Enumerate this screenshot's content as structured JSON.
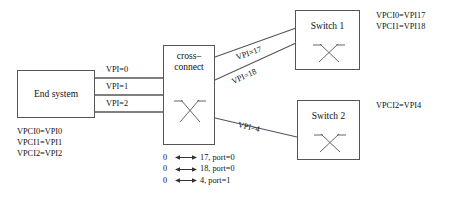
{
  "diagram": {
    "background_color": "#ffffff",
    "line_color": "#555555",
    "text_color": "#111111"
  },
  "nodes": {
    "end_system": {
      "label": "End system"
    },
    "cross_connect": {
      "label": "cross–\nconnect"
    },
    "switch1": {
      "label": "Switch 1"
    },
    "switch2": {
      "label": "Switch 2"
    }
  },
  "link_labels": {
    "vpi0": "VPI=0",
    "vpi1": "VPI=1",
    "vpi2": "VPI=2",
    "vpi17": "VPI=17",
    "vpi18": "VPI=18",
    "vpi4": "VPI=4"
  },
  "annotations": {
    "end_system_mappings": [
      "VPCI0=VPI0",
      "VPCI1=VPI1",
      "VPCI2=VPI2"
    ],
    "switch1_mappings": [
      "VPCI0=VPI17",
      "VPCI1=VPI18"
    ],
    "switch2_mappings": [
      "VPCI2=VPI4"
    ]
  },
  "legend": {
    "rows": [
      {
        "from": "0",
        "to": "17, port=0"
      },
      {
        "from": "0",
        "to": "18, port=0"
      },
      {
        "from": "0",
        "to": "4, port=1"
      }
    ]
  }
}
